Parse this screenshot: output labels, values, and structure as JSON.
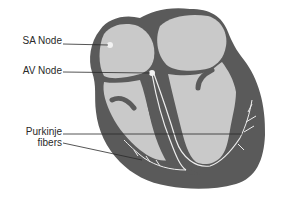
{
  "diagram": {
    "labels": {
      "sa_node": "SA Node",
      "av_node": "AV Node",
      "purkinje_line1": "Purkinje",
      "purkinje_line2": "fibers"
    },
    "colors": {
      "wall": "#5a5a5a",
      "chamber": "#c9c9c9",
      "fiber": "#eeeeee",
      "leader": "#2a2a2a",
      "node": "#f2f2f2"
    }
  }
}
